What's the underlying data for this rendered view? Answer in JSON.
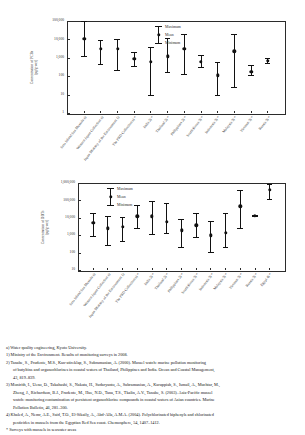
{
  "figure": {
    "background": "#ffffff",
    "marker_color": "#111111"
  },
  "chart_data": [
    {
      "id": "chart-pcbs",
      "type": "scatter",
      "title": "",
      "xlabel": "",
      "ylabel": "Concentration of PCBs\n(pg/g-wet)",
      "ylabel_line1": "Concentration of PCBs",
      "ylabel_line2": "(pg/g-wet)",
      "yscale": "log",
      "ylim": [
        1,
        100000
      ],
      "yticks": [
        1,
        10,
        100,
        1000,
        10000,
        100000
      ],
      "ytick_labels": [
        "1",
        "10",
        "100",
        "1,000",
        "10,000",
        "100,000"
      ],
      "grid": false,
      "legend_position": "top-center",
      "legend": [
        "Maximum",
        "Mean",
        "Minimum"
      ],
      "categories": [
        "Seto Inland Sea Mussels a)",
        "Western Japan Collection a)",
        "Japan Ministry of the Environment 1)",
        "The PRD Collection a) *",
        "India 2) *",
        "Thailand 2) *",
        "Philippines 2) *",
        "South Korea 3) *",
        "Indonesia 3) *",
        "Malaysia 3) *",
        "Vietnam 3) *",
        "Russia 3) *"
      ],
      "series": [
        {
          "name": "Mean",
          "values": [
            11000,
            3000,
            3200,
            850,
            600,
            1200,
            3000,
            620,
            110,
            2300,
            170,
            700
          ]
        },
        {
          "name": "Maximum",
          "values": [
            100000,
            9000,
            11000,
            2000,
            4000,
            12000,
            20000,
            1500,
            600,
            20000,
            400,
            1000
          ]
        },
        {
          "name": "Minimum",
          "values": [
            1300,
            450,
            220,
            380,
            10,
            170,
            130,
            300,
            10,
            25,
            110,
            500
          ]
        }
      ]
    },
    {
      "id": "chart-ddts",
      "type": "scatter",
      "title": "",
      "xlabel": "",
      "ylabel": "Concentration of DDTs\n(pg/g-wet)",
      "ylabel_line1": "Concentration of DDTs",
      "ylabel_line2": "(pg/g-wet)",
      "yscale": "log",
      "ylim": [
        10,
        1000000
      ],
      "yticks": [
        10,
        100,
        1000,
        10000,
        100000,
        1000000
      ],
      "ytick_labels": [
        "10",
        "100",
        "1,000",
        "10,000",
        "100,000",
        "1,000,000"
      ],
      "grid": false,
      "legend_position": "top-left",
      "legend": [
        "Maximum",
        "Mean",
        "Minimum"
      ],
      "categories": [
        "Seto Inland Sea Mussels a)",
        "Western Japan Collection a)",
        "Japan Ministry of the Environment 1)",
        "The PRD Collection a) *",
        "India 2) *",
        "Thailand 2) *",
        "Philippines 2) *",
        "South Korea 3) *",
        "Indonesia 3) *",
        "Malaysia 3) *",
        "Vietnam 3) *",
        "Russia 3) *",
        "Egypt 4) *"
      ],
      "series": [
        {
          "name": "Mean",
          "values": [
            5000,
            2500,
            3000,
            12000,
            12000,
            6000,
            1900,
            3800,
            1000,
            1400,
            45000,
            13000,
            400000
          ]
        },
        {
          "name": "Maximum",
          "values": [
            20000,
            13000,
            11000,
            55000,
            90000,
            70000,
            9000,
            18000,
            6500,
            18000,
            400000,
            14000,
            900000
          ]
        },
        {
          "name": "Minimum",
          "values": [
            900,
            260,
            450,
            2500,
            1100,
            1300,
            200,
            800,
            110,
            200,
            2700,
            12000,
            120000
          ]
        }
      ]
    }
  ],
  "notes": {
    "a": "a) Water quality engineering, Kyoto University.",
    "ref1": "1) Ministry of the Environment. Results of monitoring surveys in 2008.",
    "ref2_l1": "2) Tanabe, S., Prudente, M.S., Kan-atireklap, S., Subramanian, A. (2000). Mussel watch: marine pollution monitoring",
    "ref2_l2": "of butyltins and organochlorines in coastal waters of Thailand, Philippines and India. Ocean and Coastal Management,",
    "ref2_l3": "43, 819–839.",
    "ref3_l1": "3) Monirith, I., Ueno, D., Takahashi, S., Nakata, H., Sudaryanto, A., Subramanian, A., Karuppiah, S., Ismail, A., Muchtar, M.,",
    "ref3_l2": "Zheng, J., Richardson, B.J., Prudente, M., Hue, N.D., Tana, T.S., Tkalin, A.V., Tanabe, S. (2003). Asia-Pacific mussel",
    "ref3_l3": "watch: monitoring contamination of persistent organochlorine compounds in coastal waters of Asian countries. Marine",
    "ref3_l4": "Pollution Bulletin, 46, 281–300.",
    "ref4_l1": "4) Khaled, A., Nemr, A.E., Said, T.O., El-Sikaily, A., Abd-Alla, A.M.A. (2004). Polychlorinated biphenyls and chlorinated",
    "ref4_l2": "pesticides in mussels from the Egyptian Red Sea coast. Chemosphere, 54, 1407–1412.",
    "star": "* Surveys with mussels in seawater areas"
  }
}
